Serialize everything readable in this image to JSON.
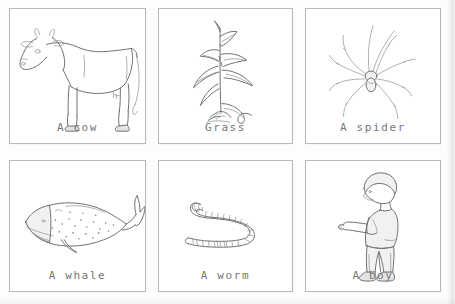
{
  "worksheet": {
    "title": "Living things picture cards",
    "columns": 3,
    "rows": 2,
    "caption_color": "#77767a",
    "card_border_color": "#b9b9b9",
    "background_color": "#fdfdfd"
  },
  "cards": [
    {
      "id": "cow",
      "label": "A cow",
      "illustration": "cow-drawing",
      "row": 1,
      "column": 1
    },
    {
      "id": "grass",
      "label": "Grass",
      "illustration": "grass-drawing",
      "row": 1,
      "column": 2
    },
    {
      "id": "spider",
      "label": "A spider",
      "illustration": "spider-drawing",
      "row": 1,
      "column": 3
    },
    {
      "id": "whale",
      "label": "A whale",
      "illustration": "whale-drawing",
      "row": 2,
      "column": 1
    },
    {
      "id": "worm",
      "label": "A worm",
      "illustration": "worm-drawing",
      "row": 2,
      "column": 2
    },
    {
      "id": "boy",
      "label": "A boy",
      "illustration": "boy-drawing",
      "row": 2,
      "column": 3
    }
  ]
}
